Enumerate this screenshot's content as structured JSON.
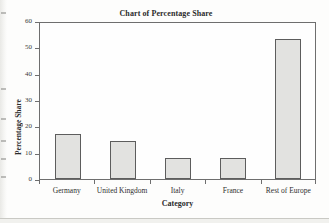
{
  "chart_data": {
    "type": "bar",
    "title": "Chart of Percentage Share",
    "xlabel": "Category",
    "ylabel": "Percentage Share",
    "categories": [
      "Germany",
      "United Kingdom",
      "Italy",
      "France",
      "Rest of Europe"
    ],
    "values": [
      17,
      14.4,
      8,
      8,
      53
    ],
    "ylim": [
      0,
      60
    ],
    "yticks": [
      0,
      10,
      20,
      30,
      40,
      50,
      60
    ],
    "grid": false,
    "legend": null,
    "colors": {
      "bar_fill": "#e2e2e0",
      "bar_border": "#5d5d5d",
      "axis": "#6e6e6e",
      "text": "#2b2b2b",
      "plot_background": "#fefefe"
    }
  }
}
